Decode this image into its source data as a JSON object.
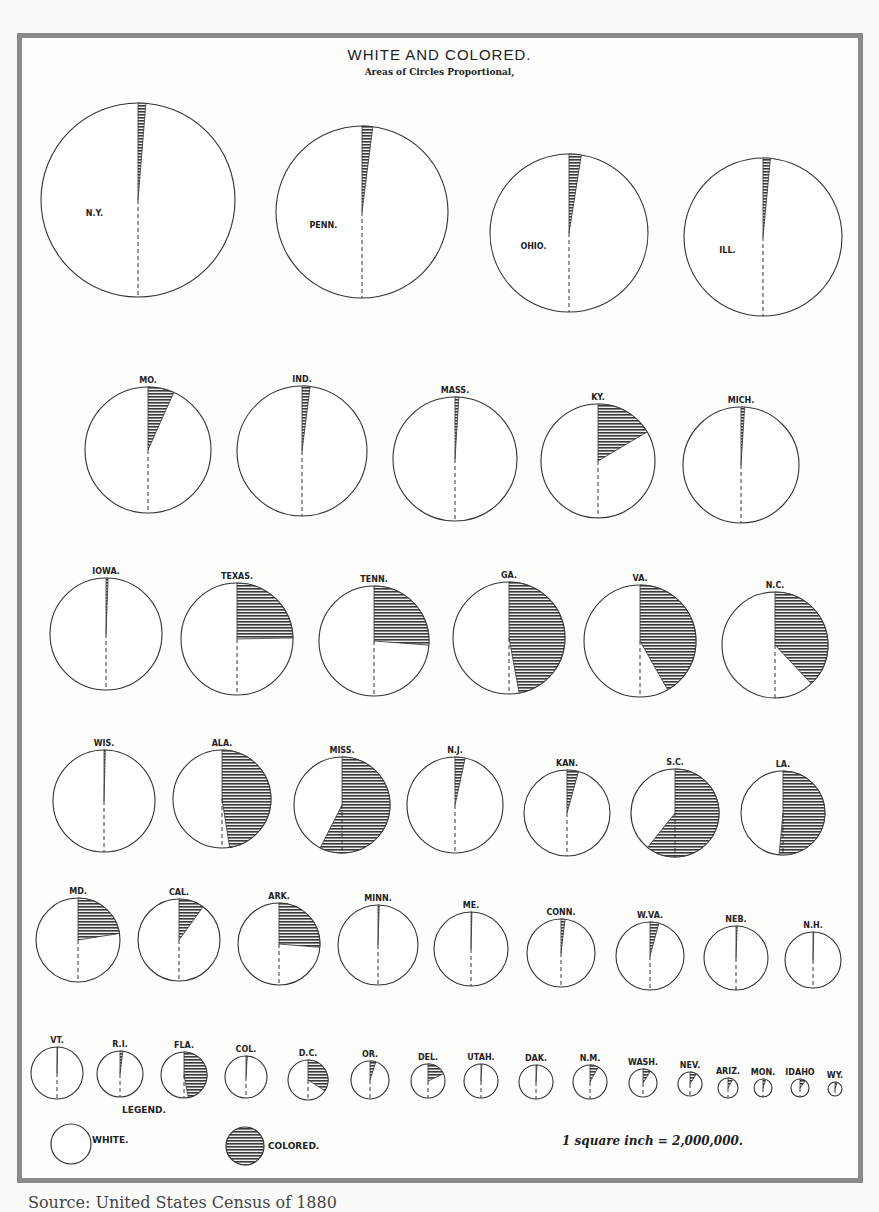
{
  "header": {
    "title": "WHITE AND COLORED.",
    "subtitle": "Areas of Circles Proportional,"
  },
  "legend": {
    "title": "LEGEND.",
    "white_label": "WHITE.",
    "colored_label": "COLORED.",
    "scale_note": "1 square inch = 2,000,000."
  },
  "source_caption": "Source: United States Census of 1880",
  "colors": {
    "frame": "#8a8a8a",
    "ink": "#222222",
    "hatch": "#333333",
    "paper": "#fdfdfc"
  },
  "chart_data": {
    "type": "pie",
    "title": "WHITE AND COLORED.",
    "subtitle": "Areas of Circles Proportional,",
    "legend": [
      "WHITE.",
      "COLORED."
    ],
    "note": "Each circle's area is proportional to state population; hatched wedge (starting at 12 o'clock, clockwise) = colored share. Dashed line marks the half-way radius.",
    "scale": "1 square inch = 2,000,000.",
    "series": [
      {
        "name": "N.Y.",
        "colored_pct": 1.3,
        "cx": 138,
        "cy": 200,
        "r": 97
      },
      {
        "name": "PENN.",
        "colored_pct": 2.0,
        "cx": 362,
        "cy": 212,
        "r": 86
      },
      {
        "name": "OHIO.",
        "colored_pct": 2.5,
        "cx": 569,
        "cy": 233,
        "r": 79
      },
      {
        "name": "ILL.",
        "colored_pct": 1.5,
        "cx": 763,
        "cy": 237,
        "r": 79
      },
      {
        "name": "MO.",
        "colored_pct": 6.7,
        "cx": 148,
        "cy": 450,
        "r": 63
      },
      {
        "name": "IND.",
        "colored_pct": 2.0,
        "cx": 302,
        "cy": 451,
        "r": 65
      },
      {
        "name": "MASS.",
        "colored_pct": 1.0,
        "cx": 455,
        "cy": 459,
        "r": 62
      },
      {
        "name": "KY.",
        "colored_pct": 16.5,
        "cx": 598,
        "cy": 461,
        "r": 57
      },
      {
        "name": "MICH.",
        "colored_pct": 1.0,
        "cx": 741,
        "cy": 465,
        "r": 58
      },
      {
        "name": "IOWA.",
        "colored_pct": 0.6,
        "cx": 106,
        "cy": 634,
        "r": 56
      },
      {
        "name": "TEXAS.",
        "colored_pct": 24.7,
        "cx": 237,
        "cy": 639,
        "r": 56
      },
      {
        "name": "TENN.",
        "colored_pct": 26.2,
        "cx": 374,
        "cy": 641,
        "r": 55
      },
      {
        "name": "GA.",
        "colored_pct": 47.1,
        "cx": 509,
        "cy": 638,
        "r": 56
      },
      {
        "name": "VA.",
        "colored_pct": 41.8,
        "cx": 640,
        "cy": 641,
        "r": 56
      },
      {
        "name": "N.C.",
        "colored_pct": 38.0,
        "cx": 775,
        "cy": 645,
        "r": 53
      },
      {
        "name": "WIS.",
        "colored_pct": 0.2,
        "cx": 104,
        "cy": 801,
        "r": 51
      },
      {
        "name": "ALA.",
        "colored_pct": 47.5,
        "cx": 222,
        "cy": 799,
        "r": 49
      },
      {
        "name": "MISS.",
        "colored_pct": 57.5,
        "cx": 342,
        "cy": 805,
        "r": 48
      },
      {
        "name": "N.J.",
        "colored_pct": 3.4,
        "cx": 455,
        "cy": 805,
        "r": 48
      },
      {
        "name": "KAN.",
        "colored_pct": 4.3,
        "cx": 567,
        "cy": 813,
        "r": 43
      },
      {
        "name": "S.C.",
        "colored_pct": 60.7,
        "cx": 675,
        "cy": 813,
        "r": 44
      },
      {
        "name": "LA.",
        "colored_pct": 51.5,
        "cx": 783,
        "cy": 813,
        "r": 42
      },
      {
        "name": "MD.",
        "colored_pct": 22.5,
        "cx": 78,
        "cy": 940,
        "r": 42
      },
      {
        "name": "CAL.",
        "colored_pct": 10.0,
        "cx": 179,
        "cy": 940,
        "r": 41
      },
      {
        "name": "ARK.",
        "colored_pct": 26.3,
        "cx": 279,
        "cy": 944,
        "r": 41
      },
      {
        "name": "MINN.",
        "colored_pct": 0.5,
        "cx": 378,
        "cy": 945,
        "r": 40
      },
      {
        "name": "ME.",
        "colored_pct": 0.2,
        "cx": 471,
        "cy": 949,
        "r": 37
      },
      {
        "name": "CONN.",
        "colored_pct": 1.9,
        "cx": 561,
        "cy": 953,
        "r": 34
      },
      {
        "name": "W.VA.",
        "colored_pct": 4.2,
        "cx": 650,
        "cy": 956,
        "r": 34
      },
      {
        "name": "NEB.",
        "colored_pct": 0.6,
        "cx": 736,
        "cy": 958,
        "r": 32
      },
      {
        "name": "N.H.",
        "colored_pct": 0.2,
        "cx": 813,
        "cy": 960,
        "r": 28
      },
      {
        "name": "VT.",
        "colored_pct": 0.3,
        "cx": 57,
        "cy": 1073,
        "r": 26
      },
      {
        "name": "R.I.",
        "colored_pct": 2.0,
        "cx": 120,
        "cy": 1074,
        "r": 23
      },
      {
        "name": "FLA.",
        "colored_pct": 47.0,
        "cx": 184,
        "cy": 1075,
        "r": 23
      },
      {
        "name": "COL.",
        "colored_pct": 1.0,
        "cx": 246,
        "cy": 1077,
        "r": 21
      },
      {
        "name": "D.C.",
        "colored_pct": 34.0,
        "cx": 308,
        "cy": 1080,
        "r": 20
      },
      {
        "name": "OR.",
        "colored_pct": 5.0,
        "cx": 370,
        "cy": 1080,
        "r": 19
      },
      {
        "name": "DEL.",
        "colored_pct": 18.0,
        "cx": 428,
        "cy": 1081,
        "r": 17
      },
      {
        "name": "UTAH.",
        "colored_pct": 0.8,
        "cx": 481,
        "cy": 1081,
        "r": 17
      },
      {
        "name": "DAK.",
        "colored_pct": 1.0,
        "cx": 536,
        "cy": 1082,
        "r": 17
      },
      {
        "name": "N.M.",
        "colored_pct": 8.0,
        "cx": 590,
        "cy": 1082,
        "r": 17
      },
      {
        "name": "WASH.",
        "colored_pct": 9.0,
        "cx": 643,
        "cy": 1083,
        "r": 14
      },
      {
        "name": "NEV.",
        "colored_pct": 9.0,
        "cx": 690,
        "cy": 1084,
        "r": 12
      },
      {
        "name": "ARIZ.",
        "colored_pct": 8.0,
        "cx": 728,
        "cy": 1088,
        "r": 10
      },
      {
        "name": "MON.",
        "colored_pct": 5.0,
        "cx": 763,
        "cy": 1088,
        "r": 9
      },
      {
        "name": "IDAHO",
        "colored_pct": 10.0,
        "cx": 800,
        "cy": 1088,
        "r": 9
      },
      {
        "name": "WY.",
        "colored_pct": 5.0,
        "cx": 835,
        "cy": 1089,
        "r": 7
      }
    ]
  }
}
